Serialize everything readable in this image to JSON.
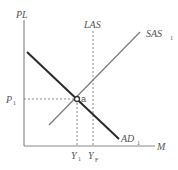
{
  "diagram": {
    "type": "AD-AS model",
    "axes": {
      "y_label": "PL",
      "x_label": "M"
    },
    "curves": {
      "las": {
        "label": "LAS"
      },
      "sas": {
        "label": "SAS",
        "subscript": "1"
      },
      "ad": {
        "label": "AD",
        "subscript": "1"
      }
    },
    "equilibrium": {
      "point_label": "a",
      "price_label": "P",
      "price_subscript": "1",
      "output_label": "Y",
      "output_subscript": "1"
    },
    "full_employment": {
      "label": "Y",
      "subscript": "F"
    },
    "colors": {
      "axis": "#8a8a8a",
      "ad": "#2a2a2a",
      "sas": "#7a7a7a",
      "dashed": "#8a8a8a",
      "text": "#555555"
    }
  }
}
